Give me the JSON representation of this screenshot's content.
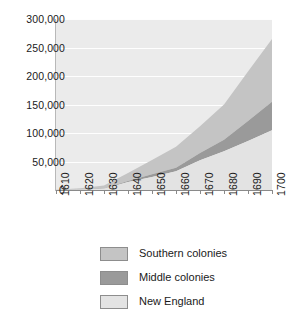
{
  "chart_data": {
    "type": "area",
    "stacked": true,
    "title": "",
    "subtitle": "",
    "xlabel": "",
    "ylabel": "",
    "clipped_top_label": "",
    "x": [
      1610,
      1620,
      1630,
      1640,
      1650,
      1660,
      1670,
      1680,
      1690,
      1700
    ],
    "xtick_labels": [
      "1610",
      "1620",
      "1630",
      "1640",
      "1650",
      "1660",
      "1670",
      "1680",
      "1690",
      "1700"
    ],
    "ytick_labels": [
      "0",
      "50,000",
      "100,000",
      "150,000",
      "200,000",
      "250,000",
      "300,000"
    ],
    "ytick_values": [
      0,
      50000,
      100000,
      150000,
      200000,
      250000,
      300000
    ],
    "ylim": [
      0,
      300000
    ],
    "xlim": [
      1610,
      1700
    ],
    "grid": true,
    "grid_color": "#ffffff",
    "plot_background": "#ebebeb",
    "legend_position": "bottom",
    "series": [
      {
        "name": "New England",
        "color": "#e3e3e3",
        "order": "bottom",
        "values": [
          0,
          500,
          2000,
          14000,
          23000,
          33000,
          52000,
          68000,
          86000,
          105000
        ]
      },
      {
        "name": "Middle colonies",
        "color": "#9a9a9a",
        "order": "middle",
        "values": [
          0,
          200,
          500,
          2000,
          4500,
          6000,
          13000,
          20000,
          35000,
          50000
        ]
      },
      {
        "name": "Southern colonies",
        "color": "#c4c4c4",
        "order": "top",
        "values": [
          400,
          2300,
          5500,
          14000,
          25000,
          37000,
          47000,
          62000,
          87000,
          110000
        ]
      }
    ],
    "stack_tops": {
      "new_england": [
        0,
        500,
        2000,
        14000,
        23000,
        33000,
        52000,
        68000,
        86000,
        105000
      ],
      "plus_middle": [
        0,
        700,
        2500,
        16000,
        27500,
        39000,
        65000,
        88000,
        121000,
        155000
      ],
      "total": [
        400,
        3000,
        8000,
        30000,
        52500,
        76000,
        112000,
        150000,
        208000,
        265000
      ]
    }
  },
  "legend": {
    "items": [
      {
        "label": "Southern colonies",
        "color": "#c4c4c4"
      },
      {
        "label": "Middle colonies",
        "color": "#9a9a9a"
      },
      {
        "label": "New England",
        "color": "#e3e3e3"
      }
    ]
  }
}
